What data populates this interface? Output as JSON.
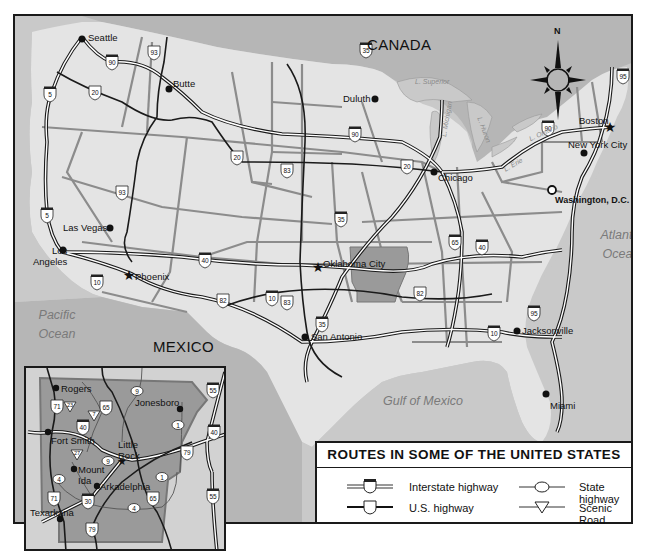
{
  "map": {
    "title": "ROUTES IN SOME OF THE UNITED STATES",
    "compass": {
      "label": "N"
    },
    "countries": [
      "CANADA",
      "MEXICO"
    ],
    "water_bodies": {
      "pacific": "Pacific\nOcean",
      "atlantic": "Atlantic\nOcean",
      "gulf": "Gulf of Mexico",
      "superior": "L. Superior",
      "michigan": "L. Michigan",
      "huron": "L. Huron",
      "erie": "L. Erie",
      "ontario": "L. Ontario"
    },
    "cities": [
      {
        "name": "Seattle",
        "type": "dot"
      },
      {
        "name": "Butte",
        "type": "dot"
      },
      {
        "name": "Duluth",
        "type": "dot"
      },
      {
        "name": "Boston",
        "type": "star"
      },
      {
        "name": "New York City",
        "type": "dot"
      },
      {
        "name": "Chicago",
        "type": "dot"
      },
      {
        "name": "Washington, D.C.",
        "type": "capital"
      },
      {
        "name": "Las Vegas",
        "type": "dot"
      },
      {
        "name": "Los Angeles",
        "type": "dot"
      },
      {
        "name": "Phoenix",
        "type": "star"
      },
      {
        "name": "Oklahoma City",
        "type": "star"
      },
      {
        "name": "San Antonio",
        "type": "dot"
      },
      {
        "name": "Jacksonville",
        "type": "dot"
      },
      {
        "name": "Miami",
        "type": "dot"
      }
    ],
    "interstate_shields": [
      "90",
      "5",
      "5",
      "90",
      "10",
      "40",
      "35",
      "35",
      "90",
      "95",
      "65",
      "40",
      "95",
      "10",
      "10",
      "35"
    ],
    "us_shields": [
      "93",
      "20",
      "93",
      "20",
      "83",
      "83",
      "20",
      "82",
      "82"
    ]
  },
  "inset": {
    "state": "Arkansas",
    "cities": [
      {
        "name": "Rogers",
        "type": "dot"
      },
      {
        "name": "Jonesboro",
        "type": "dot"
      },
      {
        "name": "Fort Smith",
        "type": "dot"
      },
      {
        "name": "Little Rock",
        "type": "star"
      },
      {
        "name": "Mount Ida",
        "type": "dot"
      },
      {
        "name": "Arkadelphia",
        "type": "dot"
      },
      {
        "name": "Texarkana",
        "type": "dot"
      }
    ],
    "interstate_shields": [
      "55",
      "40",
      "40",
      "30",
      "55"
    ],
    "us_shields": [
      "71",
      "65",
      "79",
      "71",
      "65",
      "79"
    ],
    "state_shields": [
      "9",
      "1",
      "9",
      "4",
      "1",
      "4"
    ],
    "scenic_shields": [
      "23",
      "7",
      "27"
    ]
  },
  "legend": {
    "title": "ROUTES IN SOME OF THE UNITED STATES",
    "items": [
      {
        "symbol": "interstate",
        "label": "Interstate highway"
      },
      {
        "symbol": "us",
        "label": "U.S. highway"
      },
      {
        "symbol": "state",
        "label": "State highway"
      },
      {
        "symbol": "scenic",
        "label": "Scenic Road"
      }
    ]
  },
  "colors": {
    "land": "#e4e4e4",
    "water": "#c9c9c9",
    "foreign": "#b6b6b6",
    "highlight_state": "#9a9a9a",
    "border": "#8c8c8c",
    "road": "#1a1a1a"
  }
}
